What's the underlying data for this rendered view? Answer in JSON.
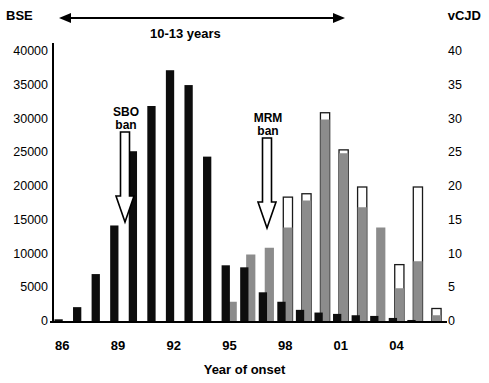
{
  "axes": {
    "left_title": "BSE",
    "right_title": "vCJD",
    "x_title": "Year of onset",
    "left_ticks": [
      "0",
      "5000",
      "10000",
      "15000",
      "20000",
      "25000",
      "30000",
      "35000",
      "40000"
    ],
    "right_ticks": [
      "0",
      "5",
      "10",
      "15",
      "20",
      "25",
      "30",
      "35",
      "40"
    ],
    "x_ticks": [
      "86",
      "89",
      "92",
      "95",
      "98",
      "01",
      "04"
    ],
    "left_min": 0,
    "left_max": 40000,
    "right_min": 0,
    "right_max": 40
  },
  "annotations": {
    "span_label": "10-13 years",
    "sbo_line1": "SBO",
    "sbo_line2": "ban",
    "mrm_line1": "MRM",
    "mrm_line2": "ban"
  },
  "colors": {
    "bse_bar": "#0d0d0d",
    "vcjd_bar": "#8c8c8c",
    "vcjd_cap_fill": "#ffffff",
    "vcjd_cap_stroke": "#1a1a1a",
    "axis": "#000000"
  },
  "chart_data": {
    "type": "bar",
    "title": "",
    "xlabel": "Year of onset",
    "ylabel": "BSE",
    "y2label": "vCJD",
    "ylim": [
      0,
      40000
    ],
    "y2lim": [
      0,
      40
    ],
    "grid": false,
    "legend": "none",
    "categories": [
      "86",
      "87",
      "88",
      "89",
      "90",
      "91",
      "92",
      "93",
      "94",
      "95",
      "96",
      "97",
      "98",
      "99",
      "00",
      "01",
      "02",
      "03",
      "04",
      "05",
      "06"
    ],
    "series": [
      {
        "name": "BSE cases",
        "axis": "left",
        "color": "#0d0d0d",
        "values": [
          400,
          2200,
          7100,
          14300,
          25300,
          32000,
          37300,
          35100,
          24500,
          8400,
          8100,
          4400,
          3000,
          1800,
          1400,
          1200,
          1000,
          900,
          600,
          300,
          150
        ]
      },
      {
        "name": "vCJD deaths",
        "axis": "right",
        "color": "#8c8c8c",
        "values": [
          0,
          0,
          0,
          0,
          0,
          0,
          0,
          0,
          0,
          3,
          10,
          11,
          14,
          18,
          30,
          25,
          17,
          14,
          5,
          9,
          1
        ]
      },
      {
        "name": "vCJD upper estimate cap",
        "axis": "right",
        "color": "#ffffff",
        "values": [
          0,
          0,
          0,
          0,
          0,
          0,
          0,
          0,
          0,
          0,
          0,
          0,
          18.5,
          19,
          31,
          25.5,
          20,
          0,
          8.5,
          20,
          2
        ]
      }
    ]
  }
}
